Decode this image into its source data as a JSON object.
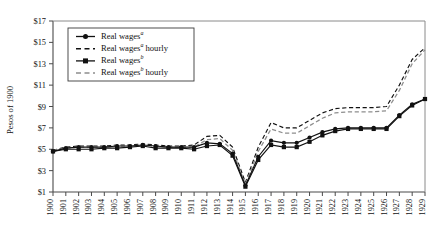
{
  "chart_data": {
    "type": "line",
    "title": "",
    "xlabel": "",
    "ylabel": "Pesos of 1900",
    "xlim": [
      1900,
      1929
    ],
    "ylim": [
      1,
      17
    ],
    "ytick_step": 2,
    "grid": false,
    "legend_position": "top-left",
    "x": [
      1900,
      1901,
      1902,
      1903,
      1904,
      1905,
      1906,
      1907,
      1908,
      1909,
      1910,
      1911,
      1912,
      1913,
      1914,
      1915,
      1916,
      1917,
      1918,
      1919,
      1920,
      1921,
      1922,
      1923,
      1924,
      1925,
      1926,
      1927,
      1928,
      1929
    ],
    "ytick_labels": [
      "$1",
      "$3",
      "$5",
      "$7",
      "$9",
      "$11",
      "$13",
      "$15",
      "$17"
    ],
    "ytick_values": [
      1,
      3,
      5,
      7,
      9,
      11,
      13,
      15,
      17
    ],
    "xtick_labels": [
      "1900",
      "1901",
      "1902",
      "1903",
      "1904",
      "1905",
      "1906",
      "1907",
      "1908",
      "1909",
      "1910",
      "1911",
      "1912",
      "1913",
      "1914",
      "1915",
      "1916",
      "1917",
      "1918",
      "1919",
      "1920",
      "1921",
      "1922",
      "1923",
      "1924",
      "1925",
      "1926",
      "1927",
      "1928",
      "1929"
    ],
    "series": [
      {
        "name": "Real wagesᵃ",
        "label_base": "Real wages",
        "label_sup": "a",
        "label_suffix": "",
        "style": "solid",
        "marker": "circle",
        "color": "#111111",
        "values": [
          4.8,
          5.1,
          5.2,
          5.2,
          5.2,
          5.3,
          5.3,
          5.4,
          5.3,
          5.2,
          5.2,
          5.2,
          5.6,
          5.5,
          4.6,
          1.6,
          4.3,
          5.8,
          5.6,
          5.6,
          6.1,
          6.6,
          6.9,
          7.0,
          7.0,
          7.0,
          7.0,
          8.2,
          9.2,
          9.7
        ]
      },
      {
        "name": "Real wagesᵃ hourly",
        "label_base": "Real wages",
        "label_sup": "a",
        "label_suffix": " hourly",
        "style": "dashed",
        "marker": "none",
        "color": "#111111",
        "values": [
          4.9,
          5.2,
          5.3,
          5.3,
          5.3,
          5.4,
          5.4,
          5.5,
          5.4,
          5.3,
          5.3,
          5.4,
          6.2,
          6.3,
          5.2,
          1.9,
          5.2,
          7.5,
          7.0,
          7.0,
          7.7,
          8.4,
          8.8,
          8.9,
          8.9,
          8.9,
          9.0,
          11.0,
          13.4,
          14.5
        ]
      },
      {
        "name": "Real wagesᵇ",
        "label_base": "Real wages",
        "label_sup": "b",
        "label_suffix": "",
        "style": "solid",
        "marker": "square",
        "color": "#111111",
        "values": [
          4.8,
          5.0,
          5.0,
          5.0,
          5.1,
          5.1,
          5.2,
          5.3,
          5.1,
          5.1,
          5.1,
          5.0,
          5.3,
          5.4,
          4.4,
          1.5,
          4.0,
          5.4,
          5.2,
          5.2,
          5.7,
          6.3,
          6.7,
          6.9,
          6.9,
          6.9,
          6.9,
          8.1,
          9.1,
          9.7
        ]
      },
      {
        "name": "Real wagesᵇ hourly",
        "label_base": "Real wages",
        "label_sup": "b",
        "label_suffix": " hourly",
        "style": "dashed",
        "marker": "none",
        "color": "#8d8d8d",
        "values": [
          4.9,
          5.1,
          5.2,
          5.2,
          5.2,
          5.3,
          5.3,
          5.4,
          5.3,
          5.2,
          5.2,
          5.2,
          5.9,
          6.0,
          4.9,
          1.7,
          4.8,
          6.9,
          6.5,
          6.5,
          7.2,
          7.9,
          8.4,
          8.5,
          8.5,
          8.5,
          8.6,
          10.5,
          13.0,
          14.3
        ]
      }
    ]
  },
  "legend": {
    "entries": [
      {
        "label_base": "Real wages",
        "label_sup": "a",
        "label_suffix": "",
        "style": "solid",
        "marker": "circle",
        "color": "#111111"
      },
      {
        "label_base": "Real wages",
        "label_sup": "a",
        "label_suffix": " hourly",
        "style": "dashed",
        "marker": "none",
        "color": "#111111"
      },
      {
        "label_base": "Real wages",
        "label_sup": "b",
        "label_suffix": "",
        "style": "solid",
        "marker": "square",
        "color": "#111111"
      },
      {
        "label_base": "Real wages",
        "label_sup": "b",
        "label_suffix": " hourly",
        "style": "dashed",
        "marker": "none",
        "color": "#8d8d8d"
      }
    ]
  },
  "axes": {
    "y_title": "Pesos of 1900"
  }
}
